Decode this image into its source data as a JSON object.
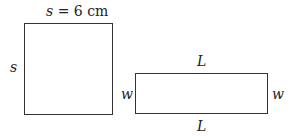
{
  "square": {
    "top_label_var": "s",
    "top_label_rest": " = 6 cm",
    "side_label": "s"
  },
  "rectangle": {
    "top_label": "L",
    "bottom_label": "L",
    "left_label": "w",
    "right_label": "w"
  }
}
